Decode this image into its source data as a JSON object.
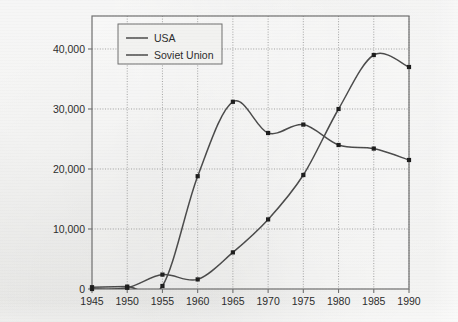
{
  "chart_data": {
    "type": "line",
    "title": "",
    "subtitle": "",
    "xlabel": "",
    "ylabel": "",
    "x": [
      1945,
      1950,
      1955,
      1960,
      1965,
      1970,
      1975,
      1980,
      1985,
      1990
    ],
    "xtick_labels": [
      "1945",
      "1950",
      "1955",
      "1960",
      "1965",
      "1970",
      "1975",
      "1980",
      "1985",
      "1990"
    ],
    "ytick_labels": [
      "0",
      "10,000",
      "20,000",
      "30,000",
      "40,000"
    ],
    "yticks": [
      0,
      10000,
      20000,
      30000,
      40000
    ],
    "xlim": [
      1945,
      1990
    ],
    "ylim": [
      0,
      45500
    ],
    "grid": true,
    "grid_style": "dotted",
    "legend_position": "top-left",
    "series": [
      {
        "name": "USA",
        "color": "#4a4a4a",
        "marker": "square",
        "smoothing": "spline",
        "values": [
          300,
          400,
          500,
          18800,
          31200,
          26000,
          27400,
          24000,
          23400,
          21500
        ]
      },
      {
        "name": "Soviet Union",
        "color": "#4a4a4a",
        "marker": "square",
        "smoothing": "spline",
        "values": [
          0,
          200,
          2400,
          1600,
          6100,
          11600,
          19000,
          30000,
          39000,
          37000
        ]
      }
    ],
    "annotations": []
  },
  "legend": {
    "entries": [
      {
        "label": "USA"
      },
      {
        "label": "Soviet Union"
      }
    ]
  },
  "colors": {
    "background": "#e9e9e7",
    "plot_frame": "#6f6f6f",
    "grid": "#9a9a9a",
    "line": "#4a4a4a",
    "text": "#2b2b2b",
    "legend_box_fill": "#f2f2f0",
    "legend_box_border": "#6f6f6f"
  }
}
